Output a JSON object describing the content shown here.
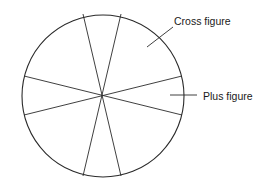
{
  "diagram": {
    "type": "sectored-circle",
    "stroke_color": "#2a2a2a",
    "background": "#ffffff",
    "circle": {
      "cx": 103,
      "cy": 96,
      "r": 81
    },
    "lines": [
      {
        "x1": 83,
        "y1": 14,
        "x2": 121,
        "y2": 176
      },
      {
        "x1": 121,
        "y1": 14,
        "x2": 83,
        "y2": 176
      },
      {
        "x1": 24,
        "y1": 76,
        "x2": 182,
        "y2": 115
      },
      {
        "x1": 24,
        "y1": 115,
        "x2": 182,
        "y2": 76
      }
    ],
    "sector_count": 8,
    "labels": {
      "cross": {
        "text": "Cross figure",
        "leader": {
          "x1": 147,
          "y1": 47,
          "x2": 173,
          "y2": 27
        }
      },
      "plus": {
        "text": "Plus figure",
        "leader": {
          "x1": 170,
          "y1": 95,
          "x2": 197,
          "y2": 95
        }
      }
    }
  }
}
